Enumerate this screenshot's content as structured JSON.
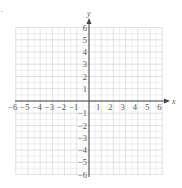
{
  "chart_data": {
    "type": "scatter",
    "title": "",
    "xlabel": "x",
    "ylabel": "y",
    "xlim": [
      -6,
      6
    ],
    "ylim": [
      -6,
      6
    ],
    "x_ticks": [
      "-6",
      "-5",
      "-4",
      "-3",
      "-2",
      "-1",
      "1",
      "2",
      "3",
      "4",
      "5",
      "6"
    ],
    "y_ticks": [
      "6",
      "5",
      "4",
      "3",
      "2",
      "1",
      "-1",
      "-2",
      "-3",
      "-4",
      "-5",
      "-6"
    ],
    "grid": true,
    "grid_minor_step": 0.5,
    "series": []
  },
  "labels": {
    "x_axis": "x",
    "y_axis": "y",
    "corner_mark": "."
  },
  "colors": {
    "axis": "#444444",
    "grid_major": "#cfcfcf",
    "grid_minor": "#e6e6e6",
    "tick_label": "#555555"
  }
}
